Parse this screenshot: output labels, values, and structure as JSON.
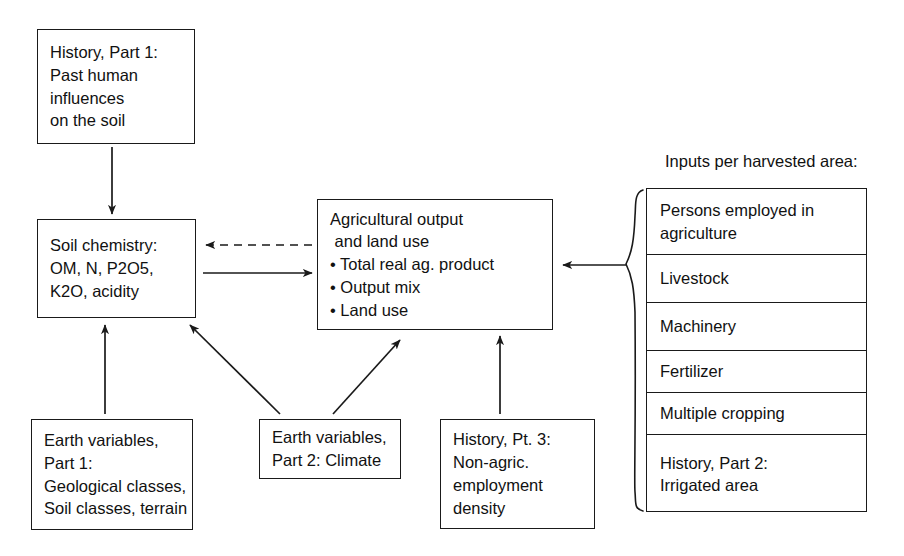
{
  "diagram": {
    "caption": "Inputs per harvested area:",
    "line_color": "#1a1a1a",
    "background": "#ffffff",
    "boxes": {
      "history_part1": {
        "name": "History, Part 1",
        "lines": [
          "History, Part 1:",
          "Past human",
          "influences",
          "on the soil"
        ]
      },
      "soil_chemistry": {
        "name": "Soil chemistry",
        "lines": [
          "Soil chemistry:",
          "OM, N, P2O5,",
          "K2O, acidity"
        ]
      },
      "agricultural_output": {
        "name": "Agricultural output and land use",
        "lines": [
          "Agricultural output",
          " and land use"
        ],
        "bullets": [
          "• Total real ag. product",
          "• Output mix",
          "• Land use"
        ]
      },
      "earth_variables_part1": {
        "name": "Earth variables, Part 1",
        "lines": [
          "Earth variables,",
          "Part 1:",
          "Geological classes,",
          "Soil classes, terrain"
        ]
      },
      "earth_variables_part2": {
        "name": "Earth variables, Part 2",
        "lines": [
          "Earth variables,",
          "Part 2: Climate"
        ]
      },
      "history_part3": {
        "name": "History, Pt. 3",
        "lines": [
          "History, Pt. 3:",
          "Non-agric.",
          "employment",
          "density"
        ]
      }
    },
    "inputs_stack": [
      {
        "lines": [
          "Persons employed in",
          "agriculture"
        ]
      },
      {
        "lines": [
          "Livestock"
        ]
      },
      {
        "lines": [
          "Machinery"
        ]
      },
      {
        "lines": [
          "Fertilizer"
        ]
      },
      {
        "lines": [
          "Multiple cropping"
        ]
      },
      {
        "lines": [
          "History, Part 2:",
          "Irrigated area"
        ]
      }
    ],
    "arrows": [
      {
        "id": "history1-to-soil",
        "style": "solid",
        "from": "history_part1",
        "to": "soil_chemistry"
      },
      {
        "id": "agoutput-to-soil",
        "style": "dashed",
        "from": "agricultural_output",
        "to": "soil_chemistry"
      },
      {
        "id": "soil-to-agoutput",
        "style": "solid",
        "from": "soil_chemistry",
        "to": "agricultural_output"
      },
      {
        "id": "earth1-to-soil",
        "style": "solid",
        "from": "earth_variables_part1",
        "to": "soil_chemistry"
      },
      {
        "id": "earth2-to-soil",
        "style": "solid",
        "from": "earth_variables_part2",
        "to": "soil_chemistry"
      },
      {
        "id": "earth2-to-agoutput",
        "style": "solid",
        "from": "earth_variables_part2",
        "to": "agricultural_output"
      },
      {
        "id": "history3-to-agoutput",
        "style": "solid",
        "from": "history_part3",
        "to": "agricultural_output"
      },
      {
        "id": "inputs-to-agoutput",
        "style": "solid",
        "from": "inputs_stack",
        "to": "agricultural_output"
      }
    ]
  }
}
